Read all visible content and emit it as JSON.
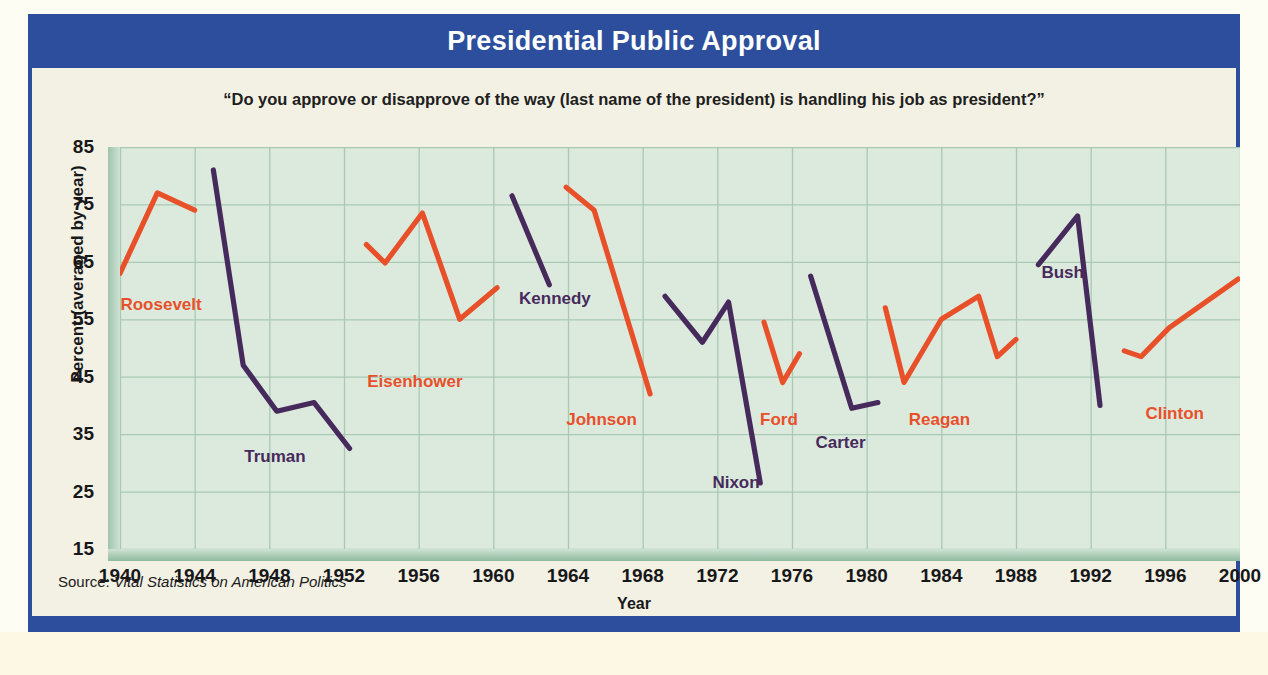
{
  "header": {
    "title": "Presidential Public Approval",
    "bar_color": "#2c4e9c"
  },
  "subtitle": "“Do you approve or disapprove of the way (last name of the president) is handling his job as president?”",
  "source": {
    "prefix": "Source: ",
    "title": "Vital Statistics on American Politics"
  },
  "colors": {
    "republican_line": "#e8502a",
    "democrat_line": "#472a5c",
    "plot_background": "#dceade",
    "panel_background": "#f3f1e4",
    "grid": "#a9c9b3"
  },
  "chart_data": {
    "type": "line",
    "title": "Presidential Public Approval",
    "subtitle": "“Do you approve or disapprove of the way (last name of the president) is handling his job as president?”",
    "xlabel": "Year",
    "ylabel": "Percent (averaged by year)",
    "xlim": [
      1940,
      2000
    ],
    "ylim": [
      15,
      85
    ],
    "xticks": [
      1940,
      1944,
      1948,
      1952,
      1956,
      1960,
      1964,
      1968,
      1972,
      1976,
      1980,
      1984,
      1988,
      1992,
      1996,
      2000
    ],
    "yticks": [
      85,
      75,
      65,
      55,
      45,
      35,
      25,
      15
    ],
    "grid": true,
    "legend": "none (inline series labels)",
    "series": [
      {
        "name": "Roosevelt",
        "color": "#e8502a",
        "label_x": 1942.2,
        "label_y": 57.5,
        "points": [
          [
            1940.0,
            63.0
          ],
          [
            1942.0,
            77.0
          ],
          [
            1944.0,
            74.0
          ]
        ]
      },
      {
        "name": "Truman",
        "color": "#472a5c",
        "label_x": 1948.3,
        "label_y": 31.0,
        "points": [
          [
            1945.0,
            81.0
          ],
          [
            1946.6,
            47.0
          ],
          [
            1948.4,
            39.0
          ],
          [
            1950.4,
            40.5
          ],
          [
            1952.3,
            32.5
          ]
        ]
      },
      {
        "name": "Eisenhower",
        "color": "#e8502a",
        "label_x": 1955.8,
        "label_y": 44.0,
        "points": [
          [
            1953.2,
            68.0
          ],
          [
            1954.2,
            64.8
          ],
          [
            1956.2,
            73.5
          ],
          [
            1958.2,
            55.0
          ],
          [
            1960.2,
            60.5
          ]
        ]
      },
      {
        "name": "Kennedy",
        "color": "#472a5c",
        "label_x": 1963.3,
        "label_y": 58.5,
        "points": [
          [
            1961.0,
            76.5
          ],
          [
            1963.0,
            61.0
          ]
        ]
      },
      {
        "name": "Johnson",
        "color": "#e8502a",
        "label_x": 1965.8,
        "label_y": 37.5,
        "points": [
          [
            1963.9,
            78.0
          ],
          [
            1965.4,
            74.0
          ],
          [
            1968.4,
            42.0
          ]
        ]
      },
      {
        "name": "Nixon",
        "color": "#472a5c",
        "label_x": 1973.0,
        "label_y": 26.5,
        "points": [
          [
            1969.2,
            59.0
          ],
          [
            1971.2,
            51.0
          ],
          [
            1972.6,
            58.0
          ],
          [
            1974.3,
            26.5
          ]
        ]
      },
      {
        "name": "Ford",
        "color": "#e8502a",
        "label_x": 1975.3,
        "label_y": 37.5,
        "points": [
          [
            1974.5,
            54.5
          ],
          [
            1975.5,
            44.0
          ],
          [
            1976.4,
            49.0
          ]
        ]
      },
      {
        "name": "Carter",
        "color": "#472a5c",
        "label_x": 1978.6,
        "label_y": 33.5,
        "points": [
          [
            1977.0,
            62.5
          ],
          [
            1979.2,
            39.5
          ],
          [
            1980.6,
            40.5
          ]
        ]
      },
      {
        "name": "Reagan",
        "color": "#e8502a",
        "label_x": 1983.9,
        "label_y": 37.5,
        "points": [
          [
            1981.0,
            57.0
          ],
          [
            1982.0,
            44.0
          ],
          [
            1984.0,
            55.0
          ],
          [
            1986.0,
            59.0
          ],
          [
            1987.0,
            48.5
          ],
          [
            1988.0,
            51.5
          ]
        ]
      },
      {
        "name": "Bush",
        "color": "#472a5c",
        "label_x": 1990.5,
        "label_y": 63.0,
        "points": [
          [
            1989.2,
            64.5
          ],
          [
            1991.3,
            73.0
          ],
          [
            1992.5,
            40.0
          ]
        ]
      },
      {
        "name": "Clinton",
        "color": "#e8502a",
        "label_x": 1996.5,
        "label_y": 38.5,
        "points": [
          [
            1993.8,
            49.5
          ],
          [
            1994.7,
            48.5
          ],
          [
            1996.2,
            53.5
          ],
          [
            1999.9,
            62.0
          ]
        ]
      }
    ]
  }
}
